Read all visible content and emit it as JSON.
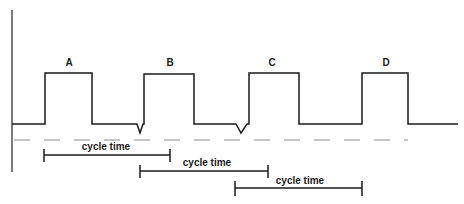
{
  "diagram": {
    "type": "timing-diagram",
    "colors": {
      "line": "#1a1a1a",
      "dash": "#8a8a8a",
      "background": "#ffffff"
    },
    "axis": {
      "x": 12,
      "y_top": 10,
      "y_bottom": 172
    },
    "baseline": {
      "y": 124,
      "x_start": 12,
      "x_end": 458
    },
    "dashed_line": {
      "y": 140,
      "x_start": 13,
      "x_end": 408
    },
    "pulses": [
      {
        "label": "A",
        "x_left": 45,
        "x_right": 92,
        "y_top": 73
      },
      {
        "label": "B",
        "x_left": 144,
        "x_right": 194,
        "y_top": 74
      },
      {
        "label": "C",
        "x_left": 249,
        "x_right": 299,
        "y_top": 73
      },
      {
        "label": "D",
        "x_left": 362,
        "x_right": 408,
        "y_top": 73
      }
    ],
    "dips": [
      {
        "x_center": 140,
        "y_tip": 133
      },
      {
        "x_center": 241,
        "y_tip": 133
      }
    ],
    "cycle_times": [
      {
        "label": "cycle time",
        "x_start": 44,
        "x_end": 170,
        "y": 155
      },
      {
        "label": "cycle time",
        "x_start": 140,
        "x_end": 268,
        "y": 171
      },
      {
        "label": "cycle time",
        "x_start": 235,
        "x_end": 362,
        "y": 188
      }
    ]
  }
}
